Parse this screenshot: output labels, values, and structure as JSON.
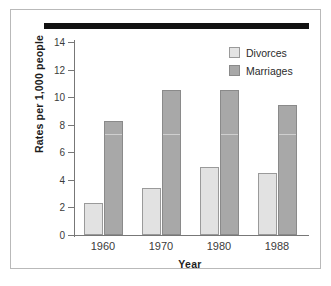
{
  "chart_data": {
    "type": "bar",
    "title": "",
    "xlabel": "Year",
    "ylabel": "Rates per 1,000 people",
    "categories": [
      "1960",
      "1970",
      "1980",
      "1988"
    ],
    "series": [
      {
        "name": "Divorces",
        "values": [
          2.3,
          3.4,
          4.9,
          4.5
        ]
      },
      {
        "name": "Marriages",
        "values": [
          8.3,
          10.5,
          10.5,
          9.4
        ]
      }
    ],
    "ylim": [
      0,
      14
    ],
    "yticks": [
      0,
      2,
      4,
      6,
      8,
      10,
      12,
      14
    ],
    "ytick_labels": [
      "0",
      "2",
      "4",
      "6",
      "8",
      "10",
      "12",
      "14"
    ],
    "grid": false,
    "legend_position": "top-right",
    "colors": {
      "divorces": "#e2e2e2",
      "marriages": "#a8a8a8",
      "axis": "#777777",
      "text": "#2b2b2b",
      "frame": "#b9b9b9",
      "top_rule": "#111111"
    }
  }
}
